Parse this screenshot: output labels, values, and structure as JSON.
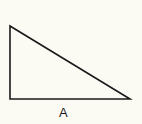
{
  "diagram": {
    "type": "right-triangle",
    "vertices": {
      "top": [
        10,
        26
      ],
      "bottom_left": [
        10,
        99
      ],
      "bottom_right": [
        130,
        99
      ]
    },
    "stroke_color": "#1a1a1a",
    "background_color": "#fbfaf3",
    "labels": {
      "base": "A"
    }
  }
}
